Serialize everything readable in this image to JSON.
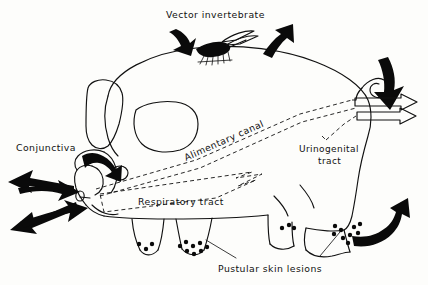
{
  "figure": {
    "kind": "hand-drawn-biological-diagram",
    "background_color": "#fdfdfb",
    "ink_color": "#111111",
    "fill_color": "#0a0a0a"
  },
  "labels": {
    "vector_invertebrate": "Vector invertebrate",
    "conjunctiva": "Conjunctiva",
    "alimentary_canal": "Alimentary canal",
    "urinogenital_tract_line1": "Urinogenital",
    "urinogenital_tract_line2": "tract",
    "respiratory_tract": "Respiratory tract",
    "pustular_skin_lesions": "Pustular skin lesions"
  },
  "icons": {
    "insect": "mosquito-vector-icon",
    "eye": "pig-eye-icon",
    "ear": "pig-ear-icon",
    "snout": "pig-snout-icon",
    "tail": "pig-curly-tail-icon",
    "lesion_dot": "pustule-dot-icon"
  },
  "arrows": [
    {
      "name": "arrow-vector-in-left",
      "direction": "down-left",
      "style": "curved-solid"
    },
    {
      "name": "arrow-vector-out-right",
      "direction": "up-right",
      "style": "curved-solid"
    },
    {
      "name": "arrow-conjunctiva-in",
      "direction": "down-right",
      "style": "curved-solid"
    },
    {
      "name": "arrow-head-out-upper-left",
      "direction": "left",
      "style": "straight-solid"
    },
    {
      "name": "arrow-head-out-lower-left",
      "direction": "down-left",
      "style": "straight-solid"
    },
    {
      "name": "arrow-respiratory-in-upper",
      "direction": "right",
      "style": "curved-solid"
    },
    {
      "name": "arrow-respiratory-in-lower",
      "direction": "right",
      "style": "curved-solid"
    },
    {
      "name": "arrow-rear-down-curve",
      "direction": "down",
      "style": "curved-solid"
    },
    {
      "name": "arrow-alimentary-out-upper",
      "direction": "right",
      "style": "straight-outline"
    },
    {
      "name": "arrow-urinogenital-out-lower",
      "direction": "right",
      "style": "straight-outline"
    },
    {
      "name": "arrow-skin-lesion-out",
      "direction": "up-right",
      "style": "curved-solid"
    }
  ],
  "lesion_clusters": [
    {
      "name": "foreleg-front-cluster",
      "dot_count": 3
    },
    {
      "name": "foreleg-rear-cluster",
      "dot_count": 8
    },
    {
      "name": "hindleg-front-cluster",
      "dot_count": 3
    },
    {
      "name": "hindleg-rear-cluster",
      "dot_count": 9
    }
  ]
}
